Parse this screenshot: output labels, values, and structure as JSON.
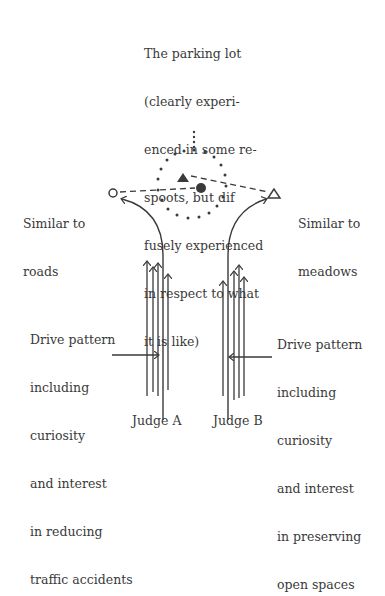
{
  "diagram": {
    "center_label": {
      "lines": [
        "The parking lot",
        "(clearly experi-",
        "enced in some re-",
        "spoots, but dif",
        "fusely experienced",
        "in respect to what",
        "it is like)"
      ]
    },
    "left_target": {
      "lines": [
        "Similar to",
        "roads"
      ],
      "symbol": "open-circle"
    },
    "right_target": {
      "lines": [
        "Similar to",
        "meadows"
      ],
      "symbol": "open-triangle"
    },
    "center_symbols": [
      "filled-triangle",
      "filled-circle",
      "dotted-circle"
    ],
    "left_drive": {
      "lines": [
        "Drive pattern",
        "including",
        "curiosity",
        "and interest",
        "in reducing",
        "traffic accidents"
      ]
    },
    "right_drive": {
      "lines": [
        "Drive pattern",
        "including",
        "curiosity",
        "and interest",
        "in preserving",
        "open spaces"
      ]
    },
    "judges": [
      "Judge A",
      "Judge B"
    ],
    "colors": {
      "ink": "#3a3a3a",
      "background": "#ffffff"
    }
  }
}
